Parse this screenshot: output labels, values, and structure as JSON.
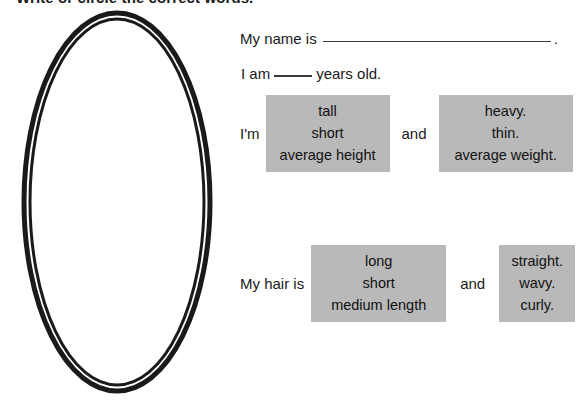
{
  "worksheet": {
    "instruction": "Write or circle the correct words.",
    "portrait_frame": "oval-portrait-frame",
    "name_line": {
      "label": "My name is",
      "blank": "",
      "end_punctuation": "."
    },
    "age_line": {
      "label_before": "I am",
      "blank": "",
      "label_after": "years old."
    },
    "body_row": {
      "label": "I'm",
      "conjunction": "and",
      "height_choices": [
        "tall",
        "short",
        "average height"
      ],
      "weight_choices": [
        "heavy.",
        "thin.",
        "average weight."
      ]
    },
    "hair_row": {
      "label": "My hair is",
      "conjunction": "and",
      "length_choices": [
        "long",
        "short",
        "medium length"
      ],
      "texture_choices": [
        "straight.",
        "wavy.",
        "curly."
      ]
    },
    "colors": {
      "choice_box_fill": "#b9b9b9",
      "ink": "#1a1a1a",
      "rule": "#3a3a3a",
      "page": "#ffffff"
    }
  }
}
